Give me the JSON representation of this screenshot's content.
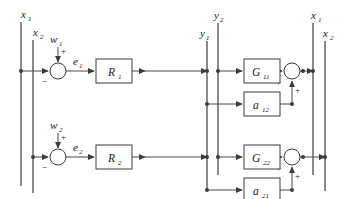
{
  "diagram": {
    "type": "block-diagram",
    "canvas": {
      "width": 349,
      "height": 199
    },
    "colors": {
      "background": "#ffffff",
      "wire": "#4a4a4a",
      "bus": "#5a5a5a",
      "block_stroke": "#3c3c3c",
      "block_fill": "#ffffff",
      "text": "#1a1a1a"
    },
    "signal_labels": {
      "x1_left": {
        "base": "x",
        "sub": "1",
        "x": 21,
        "y": 18
      },
      "x2_left": {
        "base": "x",
        "sub": "2",
        "x": 38,
        "y": 36
      },
      "w1": {
        "base": "w",
        "sub": "1",
        "x": 73,
        "y": 43
      },
      "e1": {
        "base": "e",
        "sub": "1",
        "x": 103,
        "y": 64
      },
      "w2": {
        "base": "w",
        "sub": "2",
        "x": 73,
        "y": 129
      },
      "e2": {
        "base": "e",
        "sub": "2",
        "x": 103,
        "y": 150
      },
      "y2": {
        "base": "y",
        "sub": "2",
        "x": 218,
        "y": 19
      },
      "y1": {
        "base": "y",
        "sub": "1",
        "x": 207,
        "y": 37
      },
      "x1_right": {
        "base": "x",
        "sub": "1",
        "x": 315,
        "y": 19
      },
      "x2_right": {
        "base": "x",
        "sub": "2",
        "x": 327,
        "y": 37
      }
    },
    "blocks": [
      {
        "id": "R1",
        "base": "R",
        "sub": "1",
        "x": 96,
        "y": 59,
        "w": 36,
        "h": 24
      },
      {
        "id": "R2",
        "base": "R",
        "sub": "2",
        "x": 96,
        "y": 145,
        "w": 36,
        "h": 24
      },
      {
        "id": "G11",
        "base": "G",
        "sub": "11",
        "x": 244,
        "y": 59,
        "w": 36,
        "h": 24
      },
      {
        "id": "a12",
        "base": "a",
        "sub": "12",
        "x": 244,
        "y": 92,
        "w": 36,
        "h": 24
      },
      {
        "id": "G22",
        "base": "G",
        "sub": "22",
        "x": 244,
        "y": 145,
        "w": 36,
        "h": 24
      },
      {
        "id": "a21",
        "base": "a",
        "sub": "21",
        "x": 244,
        "y": 178,
        "w": 36,
        "h": 24
      }
    ],
    "summing_junctions": [
      {
        "id": "sum-e1",
        "cx": 58,
        "cy": 71,
        "r": 8,
        "signs": [
          {
            "label": "+",
            "x": 61,
            "y": 52
          },
          {
            "label": "−",
            "x": 43,
            "y": 82
          }
        ]
      },
      {
        "id": "sum-e2",
        "cx": 58,
        "cy": 157,
        "r": 8,
        "signs": [
          {
            "label": "+",
            "x": 61,
            "y": 138
          },
          {
            "label": "−",
            "x": 43,
            "y": 168
          }
        ]
      },
      {
        "id": "sum-y1",
        "cx": 292,
        "cy": 71,
        "r": 8,
        "signs": [
          {
            "label": "+",
            "x": 278,
            "y": 83
          },
          {
            "label": "+",
            "x": 296,
            "y": 90
          }
        ]
      },
      {
        "id": "sum-y2",
        "cx": 292,
        "cy": 157,
        "r": 8,
        "signs": [
          {
            "label": "+",
            "x": 278,
            "y": 169
          },
          {
            "label": "+",
            "x": 296,
            "y": 176
          }
        ]
      }
    ],
    "vertical_buses": [
      {
        "id": "bus-x1-left",
        "x": 21,
        "y1": 22,
        "y2": 186
      },
      {
        "id": "bus-x2-left",
        "x": 33,
        "y1": 40,
        "y2": 193
      },
      {
        "id": "bus-y1",
        "x": 207,
        "y1": 41,
        "y2": 191
      },
      {
        "id": "bus-y2",
        "x": 218,
        "y1": 23,
        "y2": 175
      },
      {
        "id": "bus-x1-right",
        "x": 313,
        "y1": 23,
        "y2": 175
      },
      {
        "id": "bus-x2-right",
        "x": 325,
        "y1": 41,
        "y2": 191
      }
    ],
    "rows": {
      "top": {
        "y": 71
      },
      "bottom": {
        "y": 157
      },
      "feedback_top": {
        "y": 104
      },
      "feedback_bottom": {
        "y": 190
      }
    },
    "junction_nodes": [
      {
        "id": "node-x1-left-top",
        "x": 21,
        "y": 71
      },
      {
        "id": "node-x2-left-bottom",
        "x": 33,
        "y": 157
      },
      {
        "id": "node-r1-out-mid",
        "x": 145,
        "y": 71
      },
      {
        "id": "node-r2-out-mid",
        "x": 145,
        "y": 157
      },
      {
        "id": "node-y1-top",
        "x": 207,
        "y": 71
      },
      {
        "id": "node-y2-top",
        "x": 218,
        "y": 71
      },
      {
        "id": "node-y1-feedback-top",
        "x": 207,
        "y": 104
      },
      {
        "id": "node-y1-bottom",
        "x": 207,
        "y": 157
      },
      {
        "id": "node-y2-bottom",
        "x": 218,
        "y": 157
      },
      {
        "id": "node-y1-feedback-bottom",
        "x": 207,
        "y": 190
      },
      {
        "id": "node-sum-y1-out",
        "x": 303,
        "y": 71
      },
      {
        "id": "node-sum-y2-out",
        "x": 303,
        "y": 157
      },
      {
        "id": "node-x1-right-top",
        "x": 313,
        "y": 71
      },
      {
        "id": "node-x2-right-bottom",
        "x": 325,
        "y": 157
      }
    ]
  }
}
